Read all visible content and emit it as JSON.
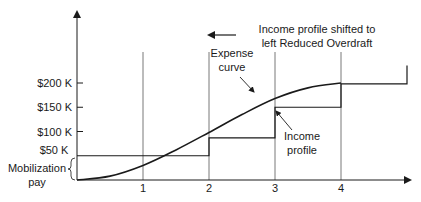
{
  "chart_data": {
    "type": "line",
    "title": "",
    "xlabel": "",
    "ylabel": "",
    "x_ticks": [
      "1",
      "2",
      "3",
      "4"
    ],
    "y_ticks": [
      {
        "value": 50,
        "label": "$50 K"
      },
      {
        "value": 100,
        "label": "$100 K"
      },
      {
        "value": 150,
        "label": "$150 K"
      },
      {
        "value": 200,
        "label": "$200 K"
      }
    ],
    "xlim": [
      0,
      5.1
    ],
    "ylim": [
      0,
      320
    ],
    "series": [
      {
        "name": "Expense curve",
        "kind": "s-curve",
        "points": [
          [
            0,
            0
          ],
          [
            0.5,
            8
          ],
          [
            1,
            30
          ],
          [
            1.5,
            62
          ],
          [
            2,
            98
          ],
          [
            2.5,
            135
          ],
          [
            3,
            168
          ],
          [
            3.5,
            190
          ],
          [
            4,
            200
          ]
        ]
      },
      {
        "name": "Income profile",
        "kind": "step",
        "steps": [
          {
            "from": 0,
            "to": 2,
            "value": 50
          },
          {
            "from": 2,
            "to": 3,
            "value": 87
          },
          {
            "from": 3,
            "to": 4,
            "value": 150
          },
          {
            "from": 4,
            "to": 5,
            "value": 198
          }
        ],
        "final_rise_to": 236
      }
    ],
    "annotations": [
      {
        "id": "expense",
        "text_lines": [
          "Expense",
          "curve"
        ]
      },
      {
        "id": "income",
        "text_lines": [
          "Income",
          "profile"
        ]
      },
      {
        "id": "shift",
        "text_lines": [
          "Income profile shifted to",
          "left Reduced Overdraft"
        ]
      },
      {
        "id": "mobilization",
        "text_lines": [
          "Mobilization",
          "pay"
        ]
      }
    ]
  }
}
